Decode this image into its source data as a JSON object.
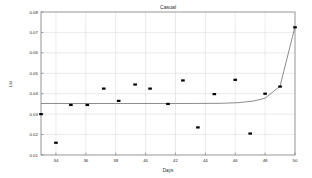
{
  "chart_data": {
    "type": "scatter",
    "title": "Casual",
    "xlabel": "Days",
    "ylabel": "Lbl",
    "xlim": [
      33,
      50
    ],
    "ylim": [
      0.01,
      0.08
    ],
    "grid": true,
    "legend": false,
    "xticks": [
      34,
      36,
      38,
      40,
      42,
      44,
      46,
      48,
      50
    ],
    "xtick_labels": [
      "34",
      "36",
      "38",
      "40",
      "42",
      "44",
      "46",
      "48",
      "50"
    ],
    "yticks": [
      0.01,
      0.02,
      0.03,
      0.04,
      0.05,
      0.06,
      0.07,
      0.08
    ],
    "ytick_labels": [
      "0.01",
      "0.02",
      "0.03",
      "0.04",
      "0.05",
      "0.06",
      "0.07",
      "0.08"
    ],
    "series": [
      {
        "name": "observations",
        "marker": "square",
        "color": "#000000",
        "points": [
          {
            "x": 33.0,
            "y": 0.03
          },
          {
            "x": 34.0,
            "y": 0.016
          },
          {
            "x": 35.0,
            "y": 0.0345
          },
          {
            "x": 36.1,
            "y": 0.0345
          },
          {
            "x": 37.2,
            "y": 0.0425
          },
          {
            "x": 38.2,
            "y": 0.0365
          },
          {
            "x": 39.3,
            "y": 0.0445
          },
          {
            "x": 40.3,
            "y": 0.0425
          },
          {
            "x": 41.5,
            "y": 0.035
          },
          {
            "x": 42.5,
            "y": 0.0465
          },
          {
            "x": 43.5,
            "y": 0.0235
          },
          {
            "x": 44.6,
            "y": 0.0398
          },
          {
            "x": 46.0,
            "y": 0.0468
          },
          {
            "x": 47.0,
            "y": 0.0205
          },
          {
            "x": 48.0,
            "y": 0.04
          },
          {
            "x": 49.0,
            "y": 0.0435
          },
          {
            "x": 50.0,
            "y": 0.0725
          }
        ]
      },
      {
        "name": "fitted-curve",
        "marker": "none",
        "color": "#5a5a5a",
        "points": [
          {
            "x": 33.0,
            "y": 0.0352
          },
          {
            "x": 38.0,
            "y": 0.0352
          },
          {
            "x": 42.0,
            "y": 0.0352
          },
          {
            "x": 45.0,
            "y": 0.0353
          },
          {
            "x": 46.2,
            "y": 0.0356
          },
          {
            "x": 47.2,
            "y": 0.0364
          },
          {
            "x": 48.0,
            "y": 0.0378
          },
          {
            "x": 49.0,
            "y": 0.0437
          },
          {
            "x": 50.0,
            "y": 0.0728
          }
        ]
      }
    ]
  },
  "colors": {
    "background": "#ffffff",
    "grid": "#c9c9c9",
    "frame": "#8a8a8a",
    "marker": "#000000",
    "curve": "#5a5a5a",
    "text": "#2b2b2b"
  }
}
